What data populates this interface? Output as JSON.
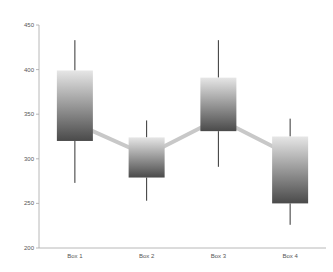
{
  "chart_data": {
    "type": "box",
    "title": "",
    "xlabel": "",
    "ylabel": "",
    "ylim": [
      200,
      450
    ],
    "yticks": [
      200,
      250,
      300,
      350,
      400,
      450
    ],
    "grid": false,
    "legend": null,
    "categories": [
      "Box 1",
      "Box 2",
      "Box 3",
      "Box 4"
    ],
    "boxes": [
      {
        "label": "Box 1",
        "min": 273,
        "q1": 320,
        "q3": 399,
        "max": 433,
        "mean": 340
      },
      {
        "label": "Box 2",
        "min": 253,
        "q1": 279,
        "q3": 324,
        "max": 343,
        "mean": 304
      },
      {
        "label": "Box 3",
        "min": 291,
        "q1": 331,
        "q3": 391,
        "max": 433,
        "mean": 345
      },
      {
        "label": "Box 4",
        "min": 226,
        "q1": 250,
        "q3": 325,
        "max": 345,
        "mean": 304
      }
    ],
    "mean_line": {
      "color": "#c8c8c8",
      "values": [
        340,
        304,
        345,
        304
      ]
    },
    "colors": {
      "box_top": "#e6e6e6",
      "box_bottom": "#4a4a4a",
      "whisker": "#333333",
      "axis": "#a6a6a6"
    }
  }
}
